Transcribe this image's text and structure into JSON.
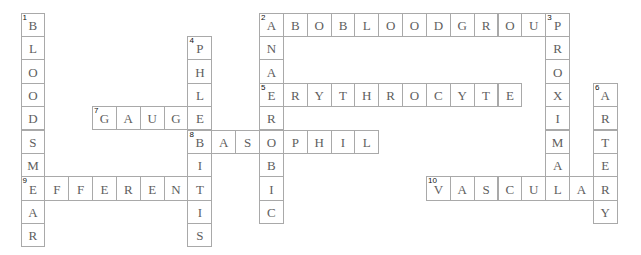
{
  "puzzle": {
    "grid": {
      "origin_x": 20.5,
      "origin_y": 12.5,
      "cell_w": 23.85,
      "cell_h": 23.4,
      "border_color": "#a9a9a9",
      "letter_color": "#5e5e5e",
      "number_color": "#111111"
    },
    "entries": [
      {
        "number": 1,
        "direction": "down",
        "col": 0,
        "row": 0,
        "answer": "BLOODSMEAR"
      },
      {
        "number": 2,
        "direction": "across",
        "col": 10,
        "row": 0,
        "answer": "ABOBLOODGROUP"
      },
      {
        "number": 2,
        "direction": "down",
        "col": 10,
        "row": 0,
        "answer": "ANAEROBIC"
      },
      {
        "number": 3,
        "direction": "down",
        "col": 22,
        "row": 0,
        "answer": "PROXIMAL"
      },
      {
        "number": 4,
        "direction": "down",
        "col": 7,
        "row": 1,
        "answer": "PHLEBITIS"
      },
      {
        "number": 5,
        "direction": "across",
        "col": 10,
        "row": 3,
        "answer": "ERYTHROCYTE"
      },
      {
        "number": 6,
        "direction": "down",
        "col": 24,
        "row": 3,
        "answer": "ARTERY"
      },
      {
        "number": 7,
        "direction": "across",
        "col": 3,
        "row": 4,
        "answer": "GAUGE"
      },
      {
        "number": 8,
        "direction": "across",
        "col": 7,
        "row": 5,
        "answer": "BASOPHIL"
      },
      {
        "number": 9,
        "direction": "across",
        "col": 0,
        "row": 7,
        "answer": "EFFERENT"
      },
      {
        "number": 10,
        "direction": "across",
        "col": 17,
        "row": 7,
        "answer": "VASCULAR"
      }
    ]
  }
}
